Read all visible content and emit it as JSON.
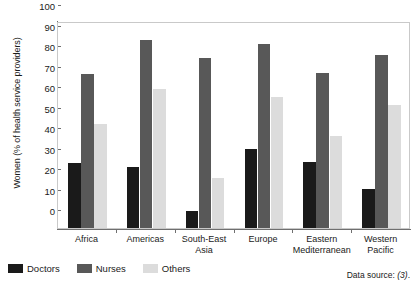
{
  "chart_data": {
    "type": "bar",
    "title": "",
    "xlabel": "",
    "ylabel": "Women (% of health service providers)",
    "ylim": [
      0,
      100
    ],
    "yticks": [
      0,
      10,
      20,
      30,
      40,
      50,
      60,
      70,
      80,
      90,
      100
    ],
    "grid": false,
    "legend_position": "bottom-left",
    "categories": [
      "Africa",
      "Americas",
      "South-East Asia",
      "Europe",
      "Eastern Mediterranean",
      "Western Pacific"
    ],
    "category_lines": [
      [
        "Africa"
      ],
      [
        "Americas"
      ],
      [
        "South-East Asia"
      ],
      [
        "Europe"
      ],
      [
        "Eastern",
        "Mediterranean"
      ],
      [
        "Western",
        "Pacific"
      ]
    ],
    "series": [
      {
        "name": "Doctors",
        "color": "#1a1a1a",
        "values": [
          31.5,
          30,
          8.5,
          38.5,
          32,
          19
        ]
      },
      {
        "name": "Nurses",
        "color": "#585858",
        "values": [
          75,
          91.5,
          83,
          90,
          75.5,
          84.5
        ]
      },
      {
        "name": "Others",
        "color": "#dcdcdc",
        "values": [
          50.5,
          68,
          24.5,
          64,
          45,
          60
        ]
      }
    ],
    "annotations": {
      "source_label": "Data source:",
      "source_ref": "(3)",
      "source_trailer": "."
    }
  },
  "legend": {
    "items": [
      {
        "label": "Doctors",
        "color": "#1a1a1a",
        "swatch": "legend-swatch-doctors"
      },
      {
        "label": "Nurses",
        "color": "#585858",
        "swatch": "legend-swatch-nurses"
      },
      {
        "label": "Others",
        "color": "#dcdcdc",
        "swatch": "legend-swatch-others"
      }
    ]
  }
}
